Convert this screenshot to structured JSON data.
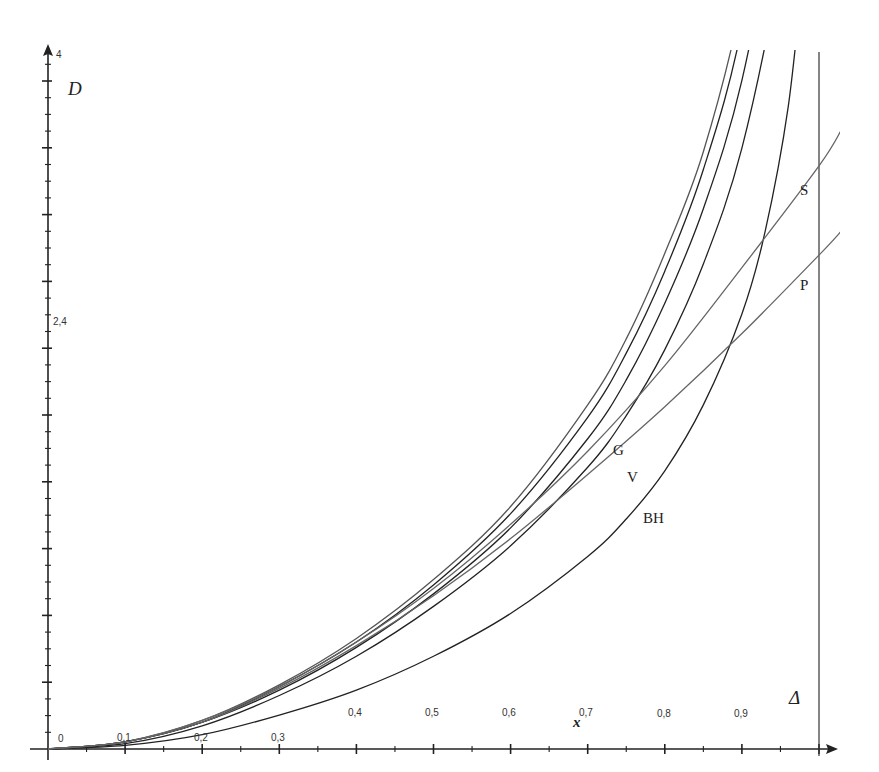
{
  "chart_data": {
    "type": "line",
    "title": "",
    "xlabel": "x",
    "ylabel": "D",
    "asymptote_label": "Δ",
    "xlim": [
      0,
      1.0
    ],
    "ylim": [
      0,
      4
    ],
    "x_ticks": [
      "0",
      "0,1",
      "0,2",
      "0,3",
      "0,4",
      "0,5",
      "0,6",
      "0,7",
      "0,8",
      "0,9"
    ],
    "y_ticks": [
      "2,4",
      "4"
    ],
    "vertical_asymptote_x": 1.0,
    "grid": false,
    "legend": "inline labels",
    "series": [
      {
        "name": "G",
        "color": "#555555",
        "x": [
          0,
          0.1,
          0.2,
          0.3,
          0.4,
          0.5,
          0.6,
          0.7,
          0.75,
          0.8,
          0.85,
          0.9,
          0.95
        ],
        "values": [
          0,
          0.04,
          0.16,
          0.36,
          0.62,
          0.95,
          1.36,
          1.93,
          2.3,
          2.78,
          3.35,
          4.2,
          5.5
        ]
      },
      {
        "name": "curve-2",
        "color": "#222222",
        "x": [
          0,
          0.1,
          0.2,
          0.3,
          0.4,
          0.5,
          0.6,
          0.7,
          0.75,
          0.8,
          0.85,
          0.9,
          0.95
        ],
        "values": [
          0,
          0.04,
          0.15,
          0.35,
          0.6,
          0.92,
          1.32,
          1.86,
          2.22,
          2.68,
          3.25,
          4.05,
          5.4
        ]
      },
      {
        "name": "V",
        "color": "#222222",
        "x": [
          0,
          0.1,
          0.2,
          0.3,
          0.4,
          0.5,
          0.6,
          0.7,
          0.75,
          0.8,
          0.85,
          0.9,
          0.95,
          0.97
        ],
        "values": [
          0,
          0.04,
          0.15,
          0.33,
          0.57,
          0.87,
          1.24,
          1.74,
          2.07,
          2.5,
          3.03,
          3.75,
          4.9,
          5.6
        ]
      },
      {
        "name": "curve-4",
        "color": "#222222",
        "x": [
          0,
          0.1,
          0.2,
          0.3,
          0.4,
          0.5,
          0.6,
          0.7,
          0.75,
          0.8,
          0.85,
          0.9,
          0.95,
          0.98
        ],
        "values": [
          0,
          0.03,
          0.13,
          0.3,
          0.52,
          0.8,
          1.14,
          1.58,
          1.87,
          2.24,
          2.72,
          3.37,
          4.4,
          5.3
        ]
      },
      {
        "name": "BH",
        "color": "#222222",
        "x": [
          0,
          0.1,
          0.2,
          0.3,
          0.4,
          0.5,
          0.6,
          0.7,
          0.75,
          0.8,
          0.85,
          0.9,
          0.93,
          0.96,
          0.98
        ],
        "values": [
          0,
          0.02,
          0.08,
          0.19,
          0.33,
          0.52,
          0.76,
          1.08,
          1.29,
          1.56,
          1.93,
          2.44,
          2.9,
          3.6,
          4.4
        ]
      },
      {
        "name": "S",
        "color": "#666666",
        "x": [
          0,
          0.1,
          0.2,
          0.3,
          0.4,
          0.5,
          0.6,
          0.7,
          0.8,
          0.9,
          1.0,
          1.03
        ],
        "values": [
          0,
          0.04,
          0.16,
          0.35,
          0.6,
          0.9,
          1.26,
          1.67,
          2.15,
          2.7,
          3.27,
          3.48
        ]
      },
      {
        "name": "P",
        "color": "#666666",
        "x": [
          0,
          0.1,
          0.2,
          0.3,
          0.4,
          0.5,
          0.6,
          0.7,
          0.8,
          0.9,
          1.0,
          1.03
        ],
        "values": [
          0,
          0.04,
          0.15,
          0.34,
          0.58,
          0.86,
          1.18,
          1.54,
          1.92,
          2.33,
          2.77,
          2.91
        ]
      }
    ],
    "annotations": [
      {
        "text": "G",
        "x": 0.737,
        "y": 1.73
      },
      {
        "text": "V",
        "x": 0.752,
        "y": 1.55
      },
      {
        "text": "BH",
        "x": 0.775,
        "y": 1.28
      },
      {
        "text": "S",
        "x": 0.97,
        "y": 3.1
      },
      {
        "text": "P",
        "x": 0.97,
        "y": 2.57
      }
    ]
  },
  "labels": {
    "y_axis_title": "D",
    "x_axis_title": "x",
    "asymptote": "Δ",
    "origin": "0",
    "y_top": "4",
    "y_mid": "2,4",
    "curve_G": "G",
    "curve_V": "V",
    "curve_BH": "BH",
    "curve_S": "S",
    "curve_P": "P",
    "x_tick_1": "0,1",
    "x_tick_2": "0,2",
    "x_tick_3": "0,3",
    "x_tick_4": "0,4",
    "x_tick_5": "0,5",
    "x_tick_6": "0,6",
    "x_tick_7": "0,7",
    "x_tick_8": "0,8",
    "x_tick_9": "0,9"
  }
}
